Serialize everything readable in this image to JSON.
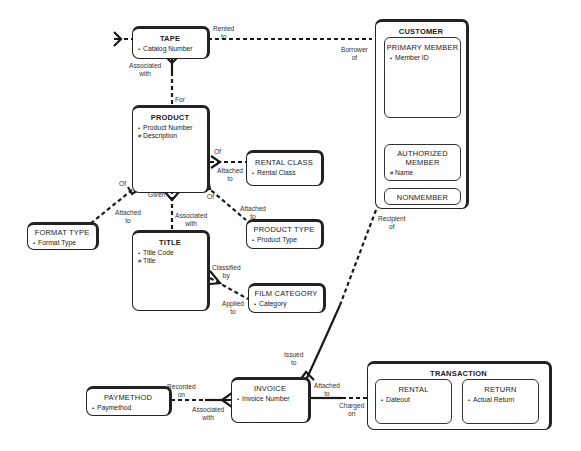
{
  "diagram": {
    "type": "entity-relationship",
    "entities": {
      "tape": {
        "name": "TAPE",
        "attributes": [
          {
            "marker": "•",
            "name": "Catalog Number"
          }
        ]
      },
      "customer": {
        "name": "CUSTOMER",
        "subtypes": {
          "primary_member": {
            "name": "PRIMARY MEMBER",
            "attributes": [
              {
                "marker": "•",
                "name": "Member ID"
              }
            ]
          },
          "authorized_member": {
            "name_line1": "AUTHORIZED",
            "name_line2": "MEMBER",
            "attributes": [
              {
                "marker": "#",
                "name": "Name"
              }
            ]
          },
          "nonmember": {
            "name": "NONMEMBER"
          }
        }
      },
      "product": {
        "name": "PRODUCT",
        "attributes": [
          {
            "marker": "•",
            "name": "Product Number"
          },
          {
            "marker": "#",
            "name": "Description"
          }
        ]
      },
      "rental_class": {
        "name": "RENTAL CLASS",
        "attributes": [
          {
            "marker": "•",
            "name": "Rental Class"
          }
        ]
      },
      "format_type": {
        "name": "FORMAT TYPE",
        "attributes": [
          {
            "marker": "•",
            "name": "Format Type"
          }
        ]
      },
      "title": {
        "name": "TITLE",
        "attributes": [
          {
            "marker": "•",
            "name": "Title Code"
          },
          {
            "marker": "#",
            "name": "Title"
          }
        ]
      },
      "product_type": {
        "name": "PRODUCT TYPE",
        "attributes": [
          {
            "marker": "•",
            "name": "Product Type"
          }
        ]
      },
      "film_category": {
        "name": "FILM CATEGORY",
        "attributes": [
          {
            "marker": "•",
            "name": "Category"
          }
        ]
      },
      "paymethod": {
        "name": "PAYMETHOD",
        "attributes": [
          {
            "marker": "•",
            "name": "Paymethod"
          }
        ]
      },
      "invoice": {
        "name": "INVOICE",
        "attributes": [
          {
            "marker": "•",
            "name": "Invoice Number"
          }
        ]
      },
      "transaction": {
        "name": "TRANSACTION",
        "subtypes": {
          "rental": {
            "name": "RENTAL",
            "attributes": [
              {
                "marker": "•",
                "name": "Dateout"
              }
            ]
          },
          "return": {
            "name": "RETURN",
            "attributes": [
              {
                "marker": "•",
                "name": "Actual Return"
              }
            ]
          }
        }
      }
    },
    "relationship_labels": {
      "rented_to": [
        "Rented",
        "to"
      ],
      "borrower_of": [
        "Borrower",
        "of"
      ],
      "associated_with_tape": [
        "Associated",
        "with"
      ],
      "for": [
        "For"
      ],
      "of_rental": [
        "Of"
      ],
      "attached_to_rental": [
        "Attached",
        "to"
      ],
      "of_format": [
        "Of"
      ],
      "given": [
        "Given"
      ],
      "associated_with_title": [
        "Associated",
        "with"
      ],
      "of_product_type": [
        "Of"
      ],
      "attached_to_format": [
        "Attached",
        "to"
      ],
      "attached_to_product_type": [
        "Attached",
        "to"
      ],
      "classified_by": [
        "Classified",
        "by"
      ],
      "applied_to": [
        "Applied",
        "to"
      ],
      "recipient_of": [
        "Recipient",
        "of"
      ],
      "issued_to": [
        "Issued",
        "to"
      ],
      "recorded_on": [
        "Recorded",
        "on"
      ],
      "associated_with_pay": [
        "Associated",
        "with"
      ],
      "attached_to_trans": [
        "Attached",
        "to"
      ],
      "charged_on": [
        "Charged",
        "on"
      ]
    }
  }
}
